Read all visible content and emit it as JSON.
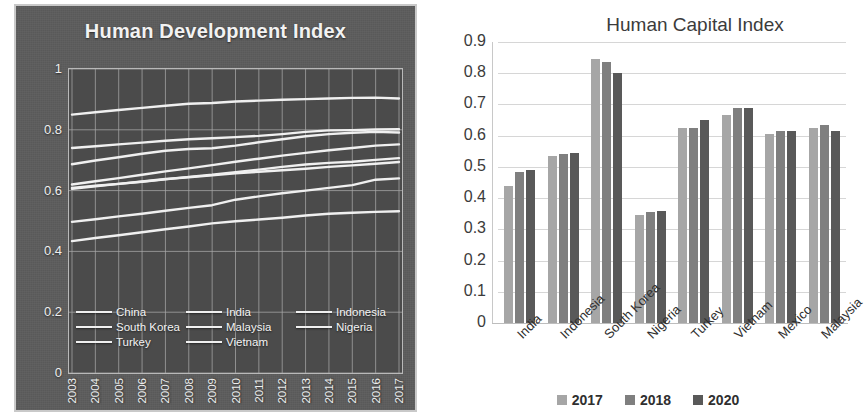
{
  "hdi": {
    "title": "Human Development Index",
    "y_ticks": [
      "1",
      "0.8",
      "0.6",
      "0.4",
      "0.2",
      "0"
    ],
    "x_ticks": [
      "2003",
      "2004",
      "2005",
      "2006",
      "2007",
      "2008",
      "2009",
      "2010",
      "2011",
      "2012",
      "2013",
      "2014",
      "2015",
      "2016",
      "2017"
    ],
    "legend": [
      "China",
      "India",
      "Indonesia",
      "South Korea",
      "Malaysia",
      "Nigeria",
      "Turkey",
      "Vietnam"
    ],
    "panel_bg": "#5d5d5d",
    "plot_bg": "#4b4b4b",
    "line_color": "#f0f0f0"
  },
  "hci": {
    "title": "Human Capital Index",
    "y_ticks": [
      "0.9",
      "0.8",
      "0.7",
      "0.6",
      "0.5",
      "0.4",
      "0.3",
      "0.2",
      "0.1",
      "0"
    ],
    "legend": [
      "2017",
      "2018",
      "2020"
    ],
    "series_colors": [
      "#a6a6a6",
      "#7f7f7f",
      "#595959"
    ]
  },
  "chart_data": [
    {
      "type": "line",
      "title": "Human Development Index",
      "xlabel": "",
      "ylabel": "",
      "ylim": [
        0,
        1
      ],
      "ytick_values": [
        0,
        0.2,
        0.4,
        0.6,
        0.8,
        1
      ],
      "grid": true,
      "legend_position": "inside-bottom",
      "x": [
        2003,
        2004,
        2005,
        2006,
        2007,
        2008,
        2009,
        2010,
        2011,
        2012,
        2013,
        2014,
        2015,
        2016,
        2017
      ],
      "series": [
        {
          "name": "China",
          "values": [
            0.62,
            0.631,
            0.641,
            0.652,
            0.663,
            0.673,
            0.684,
            0.695,
            0.705,
            0.715,
            0.724,
            0.733,
            0.74,
            0.748,
            0.752
          ]
        },
        {
          "name": "India",
          "values": [
            0.497,
            0.506,
            0.515,
            0.524,
            0.534,
            0.543,
            0.552,
            0.57,
            0.581,
            0.591,
            0.6,
            0.609,
            0.618,
            0.636,
            0.64
          ]
        },
        {
          "name": "Indonesia",
          "values": [
            0.609,
            0.616,
            0.622,
            0.629,
            0.637,
            0.645,
            0.652,
            0.661,
            0.669,
            0.678,
            0.686,
            0.691,
            0.695,
            0.701,
            0.707
          ]
        },
        {
          "name": "South Korea",
          "values": [
            0.85,
            0.858,
            0.865,
            0.872,
            0.879,
            0.886,
            0.888,
            0.893,
            0.896,
            0.899,
            0.901,
            0.903,
            0.905,
            0.906,
            0.903
          ]
        },
        {
          "name": "Malaysia",
          "values": [
            0.74,
            0.746,
            0.752,
            0.758,
            0.764,
            0.769,
            0.772,
            0.776,
            0.78,
            0.786,
            0.793,
            0.798,
            0.799,
            0.801,
            0.802
          ]
        },
        {
          "name": "Nigeria",
          "values": [
            0.434,
            0.444,
            0.453,
            0.463,
            0.473,
            0.482,
            0.492,
            0.499,
            0.505,
            0.511,
            0.518,
            0.524,
            0.527,
            0.53,
            0.532
          ]
        },
        {
          "name": "Turkey",
          "values": [
            0.687,
            0.699,
            0.71,
            0.721,
            0.731,
            0.737,
            0.739,
            0.748,
            0.759,
            0.769,
            0.779,
            0.786,
            0.79,
            0.793,
            0.791
          ]
        },
        {
          "name": "Vietnam",
          "values": [
            0.606,
            0.614,
            0.622,
            0.63,
            0.638,
            0.644,
            0.65,
            0.657,
            0.662,
            0.667,
            0.672,
            0.678,
            0.683,
            0.688,
            0.694
          ]
        }
      ]
    },
    {
      "type": "bar",
      "title": "Human Capital Index",
      "xlabel": "",
      "ylabel": "",
      "ylim": [
        0,
        0.9
      ],
      "ytick_values": [
        0,
        0.1,
        0.2,
        0.3,
        0.4,
        0.5,
        0.6,
        0.7,
        0.8,
        0.9
      ],
      "grid": true,
      "legend_position": "bottom",
      "categories": [
        "India",
        "Indonesia",
        "South Korea",
        "Nigeria",
        "Turkey",
        "Vietnam",
        "Mexico",
        "Malaysia"
      ],
      "series": [
        {
          "name": "2017",
          "values": [
            0.44,
            0.535,
            0.845,
            0.345,
            0.625,
            0.665,
            0.605,
            0.625
          ]
        },
        {
          "name": "2018",
          "values": [
            0.485,
            0.54,
            0.835,
            0.355,
            0.625,
            0.69,
            0.615,
            0.635
          ]
        },
        {
          "name": "2020",
          "values": [
            0.49,
            0.545,
            0.8,
            0.36,
            0.65,
            0.69,
            0.615,
            0.615
          ]
        }
      ]
    }
  ]
}
